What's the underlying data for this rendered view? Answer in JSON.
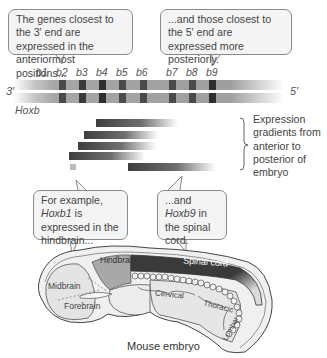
{
  "callouts": {
    "top_left": "The genes closest to the 3′ end are expressed in the anteriormost positions...",
    "top_right": "...and those closest to the 5′ end are expressed more posteriorly.",
    "bottom_left_pre": "For example, ",
    "bottom_left_gene": "Hoxb1",
    "bottom_left_post": " is expressed in the hindbrain...",
    "bottom_right_pre": "...and ",
    "bottom_right_gene": "Hoxb9",
    "bottom_right_post": " in the spinal cord."
  },
  "gene_cluster": {
    "name": "Hoxb",
    "end_left": "3′",
    "end_right": "5′",
    "genes": [
      "b1",
      "b2",
      "b3",
      "b4",
      "b5",
      "b6",
      "b7",
      "b8",
      "b9"
    ]
  },
  "gradients_label": "Expression gradients from anterior to posterior of embryo",
  "embryo": {
    "caption": "Mouse embryo",
    "regions": {
      "hindbrain": "Hindbrain",
      "midbrain": "Midbrain",
      "forebrain": "Forebrain",
      "spinal_cord": "Spinal cord",
      "cervical": "Cervical",
      "thoracic": "Thoracic",
      "lumbar": "Lumbar"
    }
  },
  "colors": {
    "band_dark": "#3a3a3a",
    "band_mid": "#6a6a6a",
    "chromosome": "#9c9c9c",
    "spinal_cord": "#3c3c3c",
    "hindbrain": "#a8a8a8",
    "embryo_fill": "#e4e4e4"
  }
}
